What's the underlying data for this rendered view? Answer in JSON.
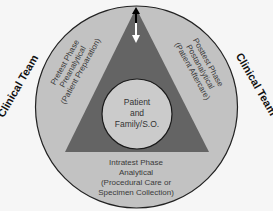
{
  "diagram": {
    "colors": {
      "background": "#f6f6f6",
      "outer_ring": "#c2c2c2",
      "triangle": "#646464",
      "inner_circle": "#cbcbcb",
      "outline": "#222222"
    },
    "left_team_label": "Clinical Team",
    "right_team_label": "Clinical Team",
    "pretest": {
      "line1": "Pretest Phase",
      "line2": "Preanalytical",
      "line3": "(Patient Preparation)"
    },
    "posttest": {
      "line1": "Posttest Phase",
      "line2": "Postanalytical",
      "line3": "(Patient Aftercare)"
    },
    "intratest": {
      "line1": "Intratest Phase",
      "line2": "Analytical",
      "line3": "(Procedural Care or",
      "line4": "Specimen Collection)"
    },
    "center": {
      "line1": "Patient",
      "line2": "and",
      "line3": "Family/S.O."
    },
    "arrows": [
      "up-arrow (black)",
      "down-arrow (white)"
    ]
  }
}
